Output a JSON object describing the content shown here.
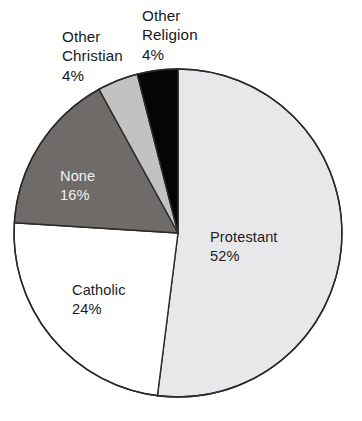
{
  "chart_data": {
    "type": "pie",
    "title": "",
    "subtitle": "",
    "xlabel": "",
    "ylabel": "",
    "legend_position": "none",
    "grid": false,
    "units": "percent",
    "total": 100,
    "start_angle_deg": 0,
    "direction": "clockwise",
    "categories": [
      "Protestant",
      "Catholic",
      "None",
      "Other Christian",
      "Other Religion"
    ],
    "values": [
      52,
      24,
      16,
      4,
      4
    ],
    "slices": [
      {
        "name": "Protestant",
        "label": "Protestant",
        "value": 52,
        "value_text": "52%",
        "color": "#e8e8ea",
        "label_color": "#1b1d1f",
        "label_placement": "inside",
        "start_deg": 0,
        "end_deg": 187.2
      },
      {
        "name": "Catholic",
        "label": "Catholic",
        "value": 24,
        "value_text": "24%",
        "color": "#ffffff",
        "label_color": "#1b1d1f",
        "label_placement": "inside",
        "start_deg": 187.2,
        "end_deg": 273.6
      },
      {
        "name": "None",
        "label": "None",
        "value": 16,
        "value_text": "16%",
        "color": "#6e6b69",
        "label_color": "#f2f2f2",
        "label_placement": "inside",
        "start_deg": 273.6,
        "end_deg": 331.2
      },
      {
        "name": "Other Christian",
        "label": "Other\nChristian",
        "value": 4,
        "value_text": "4%",
        "color": "#c2c2c2",
        "label_color": "#16181a",
        "label_placement": "outside",
        "start_deg": 331.2,
        "end_deg": 345.6
      },
      {
        "name": "Other Religion",
        "label": "Other\nReligion",
        "value": 4,
        "value_text": "4%",
        "color": "#050505",
        "label_color": "#16181a",
        "label_placement": "outside",
        "start_deg": 345.6,
        "end_deg": 360
      }
    ],
    "callouts": [
      {
        "name": "other-christian",
        "text": "Other\nChristian\n4%"
      },
      {
        "name": "other-religion",
        "text": "Other\nReligion\n4%"
      }
    ],
    "inside_labels": [
      {
        "name": "protestant",
        "text": "Protestant\n52%"
      },
      {
        "name": "catholic",
        "text": "Catholic\n24%"
      },
      {
        "name": "none",
        "text": "None\n16%"
      }
    ],
    "geometry": {
      "center_x": 178,
      "center_y": 233,
      "radius": 164,
      "outline_color": "#2a2a2a",
      "outline_width": 1.4,
      "background": "#ffffff"
    }
  }
}
